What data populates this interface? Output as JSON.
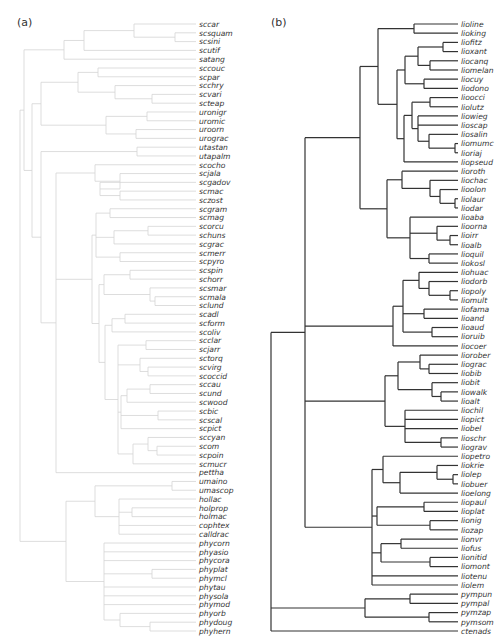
{
  "panels": [
    {
      "label": "(a)",
      "line_color": "#d4d4d4",
      "tips": [
        "sccar",
        "scsquam",
        "scsini",
        "scutif",
        "satang",
        "sccouc",
        "scpar",
        "scchry",
        "scvari",
        "scteap",
        "uronigr",
        "uromic",
        "uroorn",
        "urograc",
        "utastan",
        "utapalm",
        "scocho",
        "scjala",
        "scgadov",
        "scmac",
        "sczost",
        "scgram",
        "scmag",
        "scorcu",
        "schuns",
        "scgrac",
        "scmerr",
        "scpyro",
        "scspin",
        "schorr",
        "scsmar",
        "scmala",
        "sclund",
        "scadl",
        "scform",
        "scoliv",
        "scclar",
        "scjarr",
        "sctorq",
        "scvirg",
        "scoccid",
        "sccau",
        "scund",
        "scwood",
        "scbic",
        "scscal",
        "scpict",
        "sccyan",
        "scom",
        "scpoin",
        "scmucr",
        "pettha",
        "umaino",
        "umascop",
        "hollac",
        "holprop",
        "holmac",
        "cophtex",
        "calldrac",
        "phycorn",
        "phyasio",
        "phycora",
        "phyplat",
        "phymcl",
        "phytau",
        "physola",
        "phymod",
        "phyorb",
        "phydoug",
        "phyhern"
      ]
    },
    {
      "label": "(b)",
      "line_color": "#333333",
      "tips": [
        "lioline",
        "lioking",
        "liofitz",
        "lioxant",
        "liocanq",
        "liomelan",
        "liocuy",
        "liodono",
        "lioocci",
        "liolutz",
        "liowieg",
        "lioscap",
        "liosalin",
        "liomumc",
        "lioriaj",
        "liopseud",
        "lioroth",
        "liochac",
        "lioolon",
        "liolaur",
        "liodar",
        "lioaba",
        "lioorna",
        "lioirr",
        "lioalb",
        "lioquil",
        "liokosl",
        "liohuac",
        "liodorb",
        "liopoly",
        "liomult",
        "liofama",
        "lioand",
        "lioaud",
        "lioruib",
        "liocoer",
        "liorober",
        "liograc",
        "liobib",
        "liobit",
        "liowalk",
        "lioalt",
        "liochil",
        "liopict",
        "liobel",
        "lioschr",
        "liograv",
        "liopetro",
        "liokrie",
        "liolep",
        "liobuer",
        "lioelong",
        "liopaul",
        "lioplat",
        "lionig",
        "liozap",
        "lionvr",
        "liofus",
        "lionitid",
        "liomont",
        "liotenu",
        "liolem",
        "pympun",
        "pympal",
        "pymzap",
        "pymsom",
        "ctenads"
      ]
    }
  ]
}
